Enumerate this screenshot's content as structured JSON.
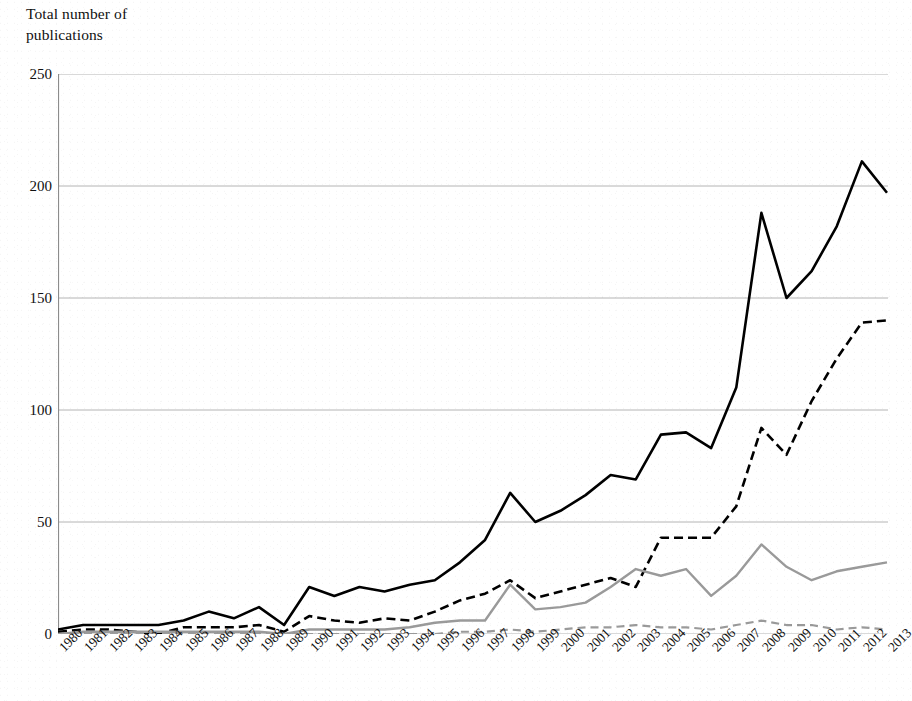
{
  "chart_data": {
    "type": "line",
    "title": "",
    "subtitle": "",
    "xlabel": "",
    "ylabel": "Total number of\npublications",
    "ylim": [
      0,
      250
    ],
    "yticks": [
      0,
      50,
      100,
      150,
      200,
      250
    ],
    "grid": "horizontal",
    "legend": "none",
    "annotations": [],
    "categories": [
      "1980",
      "1981",
      "1982",
      "1983",
      "1984",
      "1985",
      "1986",
      "1987",
      "1988",
      "1989",
      "1990",
      "1991",
      "1992",
      "1993",
      "1994",
      "1995",
      "1996",
      "1997",
      "1998",
      "1999",
      "2000",
      "2001",
      "2002",
      "2003",
      "2004",
      "2005",
      "2006",
      "2007",
      "2008",
      "2009",
      "2010",
      "2011",
      "2012",
      "2013"
    ],
    "series": [
      {
        "name": "solid-black",
        "style": "solid",
        "color": "#000000",
        "width": 2.6,
        "values": [
          2,
          4,
          4,
          4,
          4,
          6,
          10,
          7,
          12,
          4,
          21,
          17,
          21,
          19,
          22,
          24,
          32,
          42,
          63,
          50,
          55,
          62,
          71,
          69,
          89,
          90,
          83,
          110,
          188,
          150,
          162,
          182,
          211,
          197
        ]
      },
      {
        "name": "dashed-black",
        "style": "dashed",
        "color": "#000000",
        "width": 2.6,
        "values": [
          1,
          2,
          2,
          1,
          0,
          3,
          3,
          3,
          4,
          1,
          8,
          6,
          5,
          7,
          6,
          10,
          15,
          18,
          24,
          16,
          19,
          22,
          25,
          21,
          43,
          43,
          43,
          57,
          92,
          80,
          104,
          123,
          139,
          140
        ]
      },
      {
        "name": "solid-gray",
        "style": "solid",
        "color": "#9a9a9a",
        "width": 2.4,
        "values": [
          0,
          1,
          1,
          1,
          1,
          1,
          1,
          1,
          1,
          0,
          2,
          2,
          2,
          2,
          3,
          5,
          6,
          6,
          22,
          11,
          12,
          14,
          21,
          29,
          26,
          29,
          17,
          26,
          40,
          30,
          24,
          28,
          30,
          32
        ]
      },
      {
        "name": "dashed-gray",
        "style": "dashed",
        "color": "#9a9a9a",
        "width": 2.2,
        "values": [
          0,
          0,
          0,
          0,
          0,
          0,
          0,
          0,
          0,
          0,
          0,
          0,
          0,
          0,
          0,
          0,
          1,
          1,
          2,
          1,
          2,
          3,
          3,
          4,
          3,
          3,
          2,
          4,
          6,
          4,
          4,
          2,
          3,
          2
        ]
      }
    ]
  },
  "colors": {
    "gridline": "#b4b4b4",
    "axis": "#8c8c8c",
    "series_black": "#000000",
    "series_gray": "#9a9a9a",
    "background": "#ffffff",
    "text": "#111111"
  }
}
